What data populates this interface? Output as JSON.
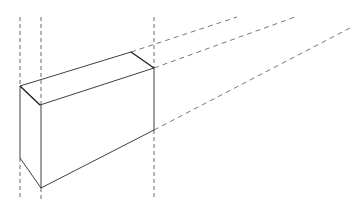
{
  "diagram": {
    "type": "perspective-box-line-drawing",
    "colors": {
      "background": "#ffffff",
      "line": "#2a2a2a",
      "dashed": "#555555"
    },
    "vertices": {
      "top_left_back": [
        20,
        86
      ],
      "top_left_front": [
        40,
        105
      ],
      "top_right_back": [
        131,
        52
      ],
      "top_right_front": [
        154,
        68
      ],
      "bottom_left_back": [
        20,
        158
      ],
      "bottom_front": [
        41,
        188
      ],
      "bottom_right_front": [
        154,
        130
      ]
    },
    "vertical_guides_x": [
      20,
      41,
      154
    ],
    "extension_lines": [
      {
        "from": [
          131,
          52
        ],
        "to": [
          237,
          17
        ]
      },
      {
        "from": [
          154,
          68
        ],
        "to": [
          295,
          17
        ]
      },
      {
        "from": [
          154,
          130
        ],
        "to": [
          350,
          28
        ]
      }
    ]
  }
}
